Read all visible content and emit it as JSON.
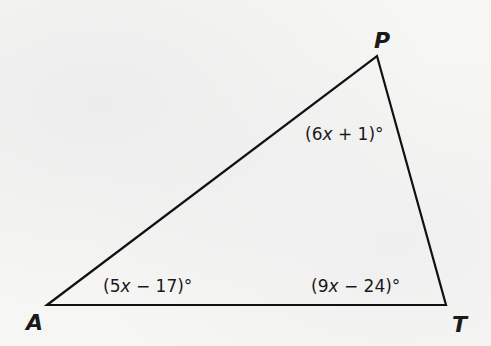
{
  "diagram": {
    "type": "triangle",
    "stroke_color": "#111111",
    "background_color": "#f6f6f5",
    "vertices": [
      {
        "name": "A",
        "label": "A",
        "x": 47,
        "y": 305,
        "label_x": 26,
        "label_y": 330
      },
      {
        "name": "P",
        "label": "P",
        "x": 377,
        "y": 56,
        "label_x": 374,
        "label_y": 48
      },
      {
        "name": "T",
        "label": "T",
        "x": 446,
        "y": 305,
        "label_x": 452,
        "label_y": 332
      }
    ],
    "angles": [
      {
        "vertex": "A",
        "prefix": "(5",
        "var": "x",
        "suffix": " − 17)°",
        "x": 103,
        "y": 292
      },
      {
        "vertex": "T",
        "prefix": "(9",
        "var": "x",
        "suffix": " − 24)°",
        "x": 311,
        "y": 292
      },
      {
        "vertex": "P",
        "prefix": "(6",
        "var": "x",
        "suffix": " + 1)°",
        "x": 305,
        "y": 140
      }
    ]
  }
}
